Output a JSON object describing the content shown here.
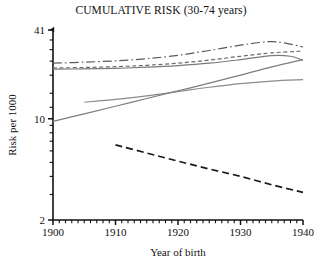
{
  "chart_data": {
    "type": "line",
    "title": "CUMULATIVE RISK (30-74 years)",
    "xlabel": "Year of birth",
    "ylabel": "Risk per 1000",
    "xlim": [
      1900,
      1940
    ],
    "ylim": [
      2,
      41
    ],
    "yscale": "log",
    "grid": false,
    "legend": "none",
    "xticks": [
      1900,
      1910,
      1920,
      1930,
      1940
    ],
    "xtick_labels": [
      "1900",
      "1910",
      "1920",
      "1930",
      "1940"
    ],
    "yticks": [
      2,
      10,
      41
    ],
    "ytick_labels": [
      "2",
      "10",
      "41"
    ],
    "x_minor_tick_step": 1,
    "series": [
      {
        "name": "series-1",
        "style": "dash-dot",
        "color": "#5a5a5a",
        "x": [
          1900,
          1905,
          1910,
          1915,
          1920,
          1925,
          1930,
          1933,
          1935,
          1937,
          1940
        ],
        "y": [
          24.2,
          24.6,
          25.1,
          26.0,
          27.4,
          29.6,
          32.2,
          33.6,
          34.1,
          33.4,
          31.3
        ]
      },
      {
        "name": "series-2",
        "style": "short-dash",
        "color": "#6b6b6b",
        "x": [
          1900,
          1905,
          1910,
          1915,
          1920,
          1925,
          1930,
          1935,
          1940
        ],
        "y": [
          22.4,
          22.6,
          22.9,
          23.4,
          24.2,
          25.4,
          27.0,
          28.5,
          29.3
        ]
      },
      {
        "name": "series-3",
        "style": "solid",
        "color": "#7a7a7a",
        "x": [
          1900,
          1905,
          1910,
          1915,
          1920,
          1925,
          1930,
          1935,
          1938,
          1940
        ],
        "y": [
          22.0,
          22.1,
          22.3,
          22.7,
          23.3,
          24.2,
          25.6,
          27.3,
          27.0,
          25.3
        ]
      },
      {
        "name": "series-4",
        "style": "solid",
        "color": "#8a8a8a",
        "x": [
          1905,
          1910,
          1915,
          1920,
          1925,
          1930,
          1935,
          1940
        ],
        "y": [
          13.0,
          13.6,
          14.4,
          15.4,
          16.5,
          17.5,
          18.2,
          18.6
        ]
      },
      {
        "name": "series-5",
        "style": "solid",
        "color": "#7d7d7d",
        "x": [
          1900,
          1905,
          1910,
          1915,
          1920,
          1925,
          1930,
          1935,
          1940
        ],
        "y": [
          9.6,
          10.8,
          12.2,
          13.8,
          15.6,
          17.6,
          20.0,
          22.8,
          25.6
        ]
      },
      {
        "name": "series-6",
        "style": "long-dash",
        "color": "#1a1a1a",
        "x": [
          1910,
          1915,
          1920,
          1925,
          1930,
          1935,
          1940
        ],
        "y": [
          6.6,
          5.8,
          5.1,
          4.5,
          4.0,
          3.5,
          3.1
        ]
      }
    ]
  }
}
